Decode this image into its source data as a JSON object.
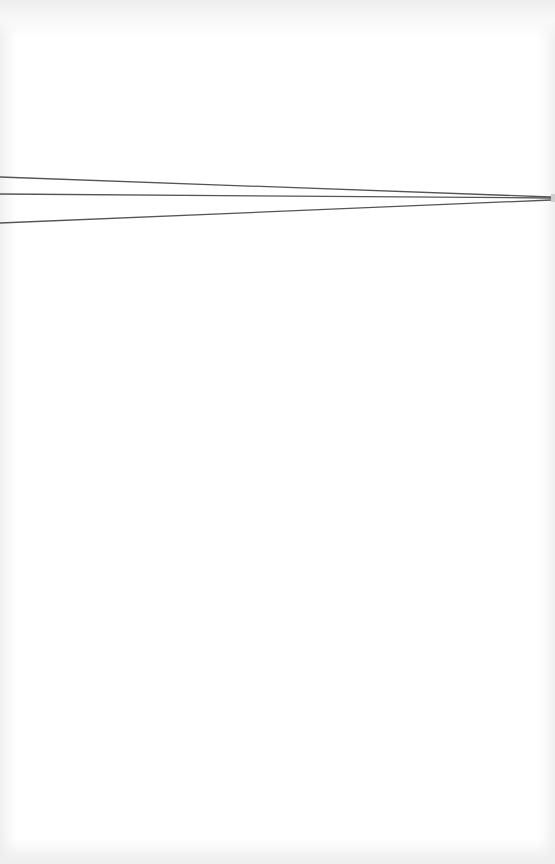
{
  "canvas": {
    "width": 555,
    "height": 864,
    "background": "#ffffff",
    "vignette_color": "#ececec"
  },
  "lines": {
    "color": "#555555",
    "stroke_width": 1.3,
    "items": [
      {
        "name": "top-line",
        "x1": 0,
        "y1": 177,
        "x2": 551,
        "y2": 197
      },
      {
        "name": "middle-line",
        "x1": 0,
        "y1": 194,
        "x2": 551,
        "y2": 198
      },
      {
        "name": "bottom-line",
        "x1": 0,
        "y1": 223,
        "x2": 551,
        "y2": 200
      }
    ],
    "end_cap": {
      "x": 551,
      "y": 194,
      "width": 4,
      "height": 8,
      "color": "#cfcfcf"
    }
  }
}
